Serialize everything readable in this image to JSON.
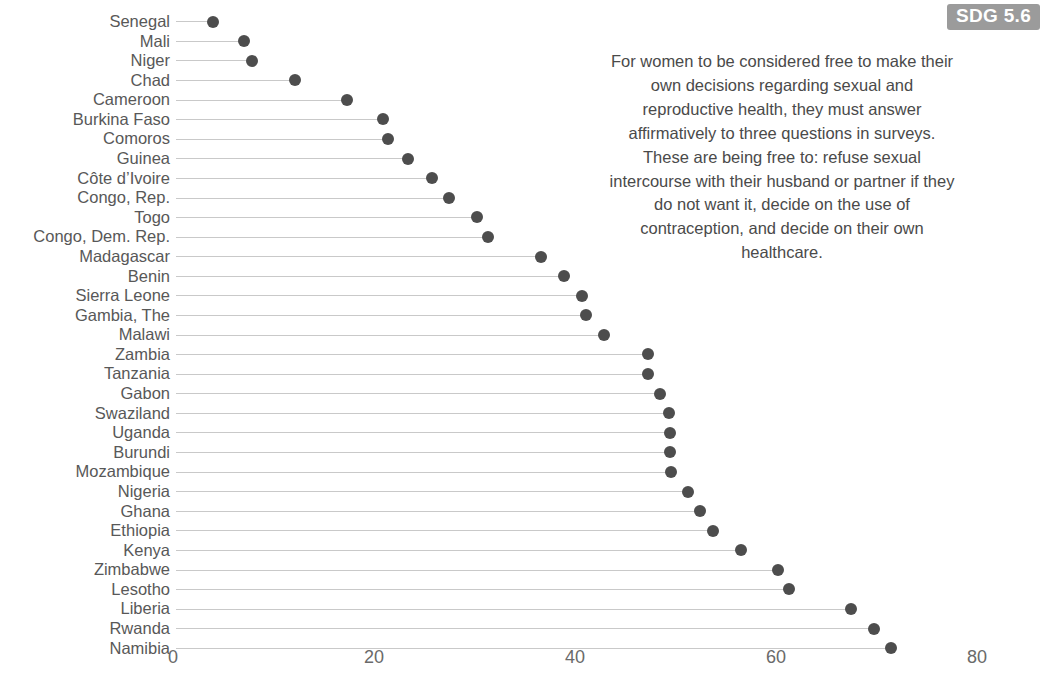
{
  "badge": {
    "label": "SDG 5.6",
    "background": "#9b9b9b",
    "text_color": "#ffffff"
  },
  "annotation": {
    "text": "For women to be considered free to make their own decisions regarding sexual and reproductive health, they must answer affirmatively to three questions in surveys. These are being free to: refuse sexual intercourse with their husband or partner if they do not want it, decide on the use of contraception, and decide on their own healthcare."
  },
  "style": {
    "dot_color": "#4d4d4d",
    "line_color": "#c9c9c9",
    "label_color": "#585858",
    "tick_color": "#6a6a6a",
    "background": "#ffffff"
  },
  "chart_data": {
    "type": "scatter",
    "subtype": "lollipop-dot-plot",
    "title": "",
    "xlabel": "",
    "ylabel": "",
    "xlim": [
      0,
      80
    ],
    "xticks": [
      0,
      20,
      40,
      60,
      80
    ],
    "xticklabels": [
      "0",
      "20",
      "40",
      "60",
      "80"
    ],
    "grid": false,
    "orientation": "horizontal",
    "legend": null,
    "categories": [
      "Senegal",
      "Mali",
      "Niger",
      "Chad",
      "Cameroon",
      "Burkina Faso",
      "Comoros",
      "Guinea",
      "Côte d’Ivoire",
      "Congo, Rep.",
      "Togo",
      "Congo, Dem. Rep.",
      "Madagascar",
      "Benin",
      "Sierra Leone",
      "Gambia, The",
      "Malawi",
      "Zambia",
      "Tanzania",
      "Gabon",
      "Swaziland",
      "Uganda",
      "Burundi",
      "Mozambique",
      "Nigeria",
      "Ghana",
      "Ethiopia",
      "Kenya",
      "Zimbabwe",
      "Lesotho",
      "Liberia",
      "Rwanda",
      "Namibia"
    ],
    "values": [
      4.0,
      7.1,
      7.9,
      12.1,
      17.3,
      20.9,
      21.4,
      23.4,
      25.8,
      27.5,
      30.2,
      31.3,
      36.6,
      38.9,
      40.7,
      41.1,
      42.9,
      47.3,
      47.3,
      48.5,
      49.4,
      49.5,
      49.5,
      49.6,
      51.2,
      52.4,
      53.7,
      56.5,
      60.2,
      61.3,
      67.5,
      69.8,
      71.4
    ]
  }
}
